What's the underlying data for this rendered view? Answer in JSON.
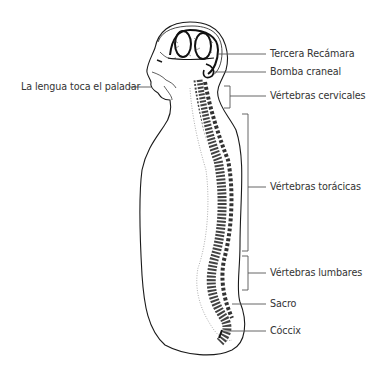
{
  "diagram": {
    "type": "anatomical-illustration",
    "colors": {
      "ink": "#1a1a1a",
      "label_text": "#333333",
      "leader_line": "#555555",
      "background": "#ffffff"
    },
    "labels": [
      {
        "id": "tercera-recamara",
        "text": "Tercera Recámara"
      },
      {
        "id": "bomba-craneal",
        "text": "Bomba craneal"
      },
      {
        "id": "lengua-paladar",
        "text": "La lengua toca el paladar"
      },
      {
        "id": "vertebras-cervicales",
        "text": "Vértebras cervicales"
      },
      {
        "id": "vertebras-toracicas",
        "text": "Vértebras torácicas"
      },
      {
        "id": "vertebras-lumbares",
        "text": "Vértebras lumbares"
      },
      {
        "id": "sacro",
        "text": "Sacro"
      },
      {
        "id": "coccix",
        "text": "Cóccix"
      }
    ]
  }
}
